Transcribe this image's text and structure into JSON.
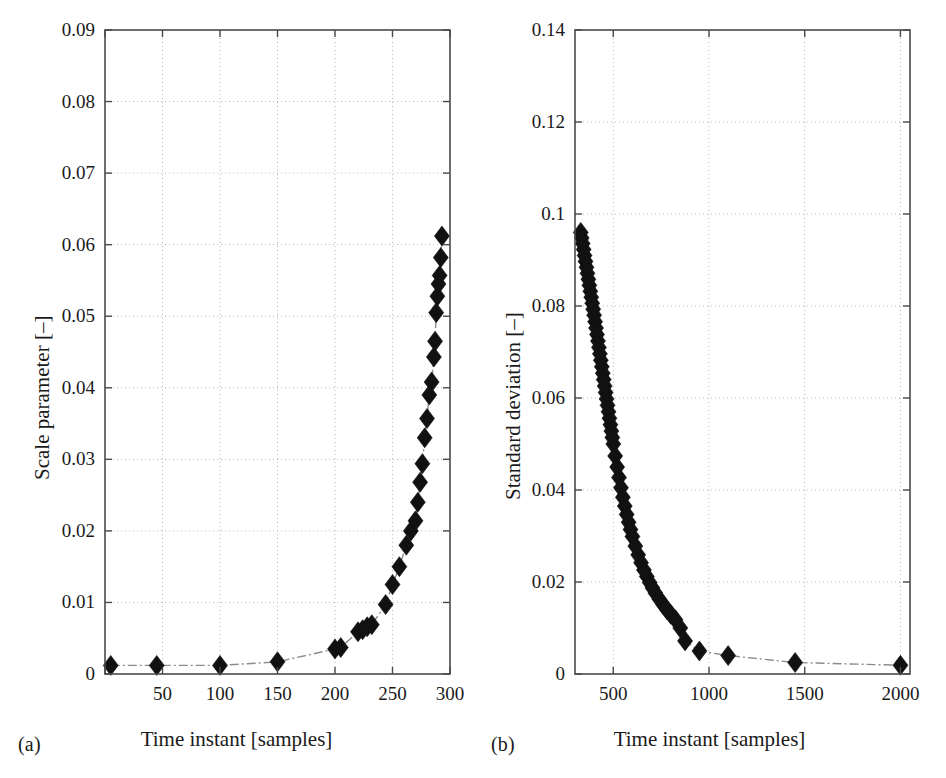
{
  "figure": {
    "background_color": "#ffffff",
    "axis_color": "#4a4a4a",
    "grid_color": "#b9b9b9",
    "marker_color": "#111111",
    "line_color": "#8c8c8c"
  },
  "panels": [
    {
      "caption": "(a)",
      "xlabel": "Time instant [samples]",
      "ylabel": "Scale parameter [–]"
    },
    {
      "caption": "(b)",
      "xlabel": "Time instant [samples]",
      "ylabel": "Standard deviation [–]"
    }
  ],
  "chart_data": [
    {
      "type": "scatter",
      "title": "",
      "panel": "(a)",
      "xlabel": "Time instant [samples]",
      "ylabel": "Scale parameter [–]",
      "xlim": [
        0,
        300
      ],
      "ylim": [
        0,
        0.09
      ],
      "xticks": [
        0,
        50,
        100,
        150,
        200,
        250,
        300
      ],
      "xticklabels": [
        "",
        "50",
        "100",
        "150",
        "200",
        "250",
        "300"
      ],
      "yticks": [
        0,
        0.01,
        0.02,
        0.03,
        0.04,
        0.05,
        0.06,
        0.07,
        0.08,
        0.09
      ],
      "yticklabels": [
        "0",
        "0.01",
        "0.02",
        "0.03",
        "0.04",
        "0.05",
        "0.06",
        "0.07",
        "0.08",
        "0.09"
      ],
      "grid": true,
      "legend": "none",
      "marker": "diamond",
      "linestyle": "dashdot",
      "x": [
        5,
        45,
        100,
        150,
        200,
        205,
        220,
        224,
        228,
        232,
        244,
        250,
        256,
        262,
        266,
        270,
        272,
        274,
        276,
        278,
        280,
        282,
        284,
        286,
        287,
        288,
        289,
        290,
        291,
        292,
        293
      ],
      "y": [
        0.0012,
        0.0012,
        0.0012,
        0.0017,
        0.0035,
        0.0037,
        0.0059,
        0.0062,
        0.0066,
        0.0069,
        0.0097,
        0.0125,
        0.015,
        0.018,
        0.02,
        0.0214,
        0.024,
        0.0268,
        0.0294,
        0.033,
        0.0357,
        0.039,
        0.0408,
        0.0443,
        0.0465,
        0.0505,
        0.0528,
        0.0545,
        0.0557,
        0.0582,
        0.0612
      ]
    },
    {
      "type": "scatter",
      "title": "",
      "panel": "(b)",
      "xlabel": "Time instant [samples]",
      "ylabel": "Standard deviation [–]",
      "xlim": [
        300,
        2050
      ],
      "ylim": [
        0,
        0.14
      ],
      "xticks": [
        500,
        1000,
        1500,
        2000
      ],
      "xticklabels": [
        "500",
        "1000",
        "1500",
        "2000"
      ],
      "yticks": [
        0,
        0.02,
        0.04,
        0.06,
        0.08,
        0.1,
        0.12,
        0.14
      ],
      "yticklabels": [
        "0",
        "0.02",
        "0.04",
        "0.06",
        "0.08",
        "0.1",
        "0.12",
        "0.14"
      ],
      "grid": true,
      "legend": "none",
      "marker": "diamond",
      "linestyle": "dashdot",
      "x": [
        330,
        335,
        340,
        345,
        350,
        355,
        360,
        365,
        370,
        375,
        380,
        385,
        390,
        395,
        400,
        405,
        410,
        415,
        420,
        425,
        430,
        435,
        440,
        445,
        450,
        455,
        460,
        465,
        470,
        475,
        480,
        485,
        490,
        495,
        500,
        510,
        520,
        530,
        540,
        550,
        560,
        570,
        580,
        590,
        600,
        615,
        630,
        645,
        660,
        675,
        690,
        705,
        720,
        740,
        760,
        780,
        800,
        825,
        850,
        875,
        950,
        1100,
        1450,
        2000
      ],
      "y": [
        0.096,
        0.0948,
        0.0936,
        0.0923,
        0.091,
        0.0897,
        0.0884,
        0.0871,
        0.0858,
        0.0845,
        0.0832,
        0.0819,
        0.0806,
        0.0793,
        0.078,
        0.0766,
        0.0752,
        0.0738,
        0.0724,
        0.071,
        0.0696,
        0.0682,
        0.0668,
        0.0654,
        0.064,
        0.0626,
        0.0612,
        0.0598,
        0.0584,
        0.057,
        0.0556,
        0.0542,
        0.0528,
        0.0514,
        0.05,
        0.0474,
        0.045,
        0.0427,
        0.0405,
        0.0384,
        0.0365,
        0.0347,
        0.033,
        0.0314,
        0.0299,
        0.0278,
        0.0259,
        0.0242,
        0.0226,
        0.0212,
        0.0199,
        0.0187,
        0.0176,
        0.0163,
        0.0151,
        0.014,
        0.013,
        0.0118,
        0.01,
        0.0072,
        0.005,
        0.004,
        0.0025,
        0.0019
      ]
    }
  ]
}
